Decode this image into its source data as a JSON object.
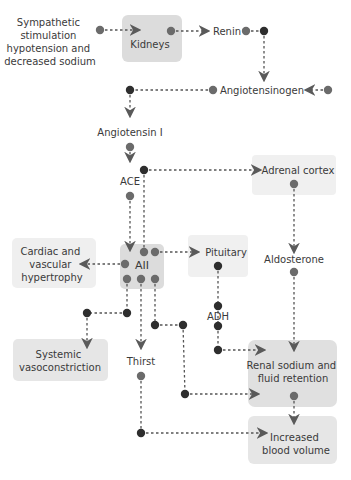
{
  "colors": {
    "box_fill": "#ececec",
    "box_fill_dark": "#dcdcdc",
    "dot_gray": "#6b6b6b",
    "dot_dark": "#2e2e2e",
    "line": "#555555",
    "arrow": "#5a5a5a",
    "text": "#3a3a3a"
  },
  "nodes": {
    "stimulus": {
      "lines": [
        "Sympathetic",
        "stimulation",
        "hypotension and",
        "decreased sodium"
      ]
    },
    "kidneys": {
      "label": "Kidneys"
    },
    "renin": {
      "label": "Renin"
    },
    "angiotensinogen": {
      "label": "Angiotensinogen"
    },
    "angiotensin1": {
      "label": "Angiotensin I"
    },
    "ace": {
      "label": "ACE"
    },
    "aii": {
      "label": "AII"
    },
    "adrenal": {
      "label": "Adrenal cortex"
    },
    "aldosterone": {
      "label": "Aldosterone"
    },
    "pituitary": {
      "label": "Pituitary"
    },
    "adh": {
      "label": "ADH"
    },
    "cardiac": {
      "lines": [
        "Cardiac and",
        "vascular",
        "hypertrophy"
      ]
    },
    "systemic": {
      "lines": [
        "Systemic",
        "vasoconstriction"
      ]
    },
    "thirst": {
      "label": "Thirst"
    },
    "renal": {
      "lines": [
        "Renal sodium and",
        "fluid retention"
      ]
    },
    "blood": {
      "lines": [
        "Increased",
        "blood volume"
      ]
    }
  }
}
